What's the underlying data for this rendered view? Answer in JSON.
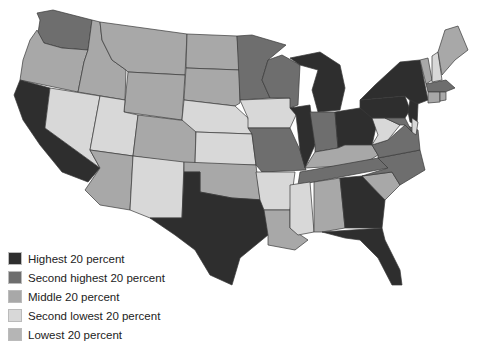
{
  "map": {
    "type": "choropleth",
    "region": "Contiguous United States",
    "legend": [
      {
        "key": "q5",
        "label": "Highest 20 percent",
        "color": "#2e2e2e"
      },
      {
        "key": "q4",
        "label": "Second highest 20 percent",
        "color": "#6e6e6e"
      },
      {
        "key": "q3",
        "label": "Middle 20 percent",
        "color": "#a8a8a8"
      },
      {
        "key": "q2",
        "label": "Second lowest 20 percent",
        "color": "#d8d8d8"
      },
      {
        "key": "q1",
        "label": "Lowest 20 percent",
        "color": "#b5b5b5"
      }
    ],
    "states": {
      "WA": "q4",
      "OR": "q3",
      "CA": "q5",
      "ID": "q3",
      "NV": "q2",
      "MT": "q3",
      "WY": "q3",
      "UT": "q2",
      "AZ": "q3",
      "CO": "q3",
      "NM": "q2",
      "ND": "q3",
      "SD": "q3",
      "NE": "q2",
      "KS": "q2",
      "OK": "q3",
      "TX": "q5",
      "MN": "q4",
      "IA": "q2",
      "MO": "q4",
      "AR": "q2",
      "LA": "q3",
      "WI": "q4",
      "IL": "q5",
      "MI": "q5",
      "IN": "q4",
      "OH": "q5",
      "KY": "q3",
      "TN": "q4",
      "MS": "q2",
      "AL": "q3",
      "GA": "q5",
      "FL": "q5",
      "SC": "q3",
      "NC": "q4",
      "VA": "q4",
      "WV": "q2",
      "PA": "q5",
      "NY": "q5",
      "NJ": "q5",
      "DE": "q2",
      "MD": "q4",
      "CT": "q3",
      "RI": "q3",
      "MA": "q4",
      "VT": "q3",
      "NH": "q2",
      "ME": "q3"
    }
  }
}
